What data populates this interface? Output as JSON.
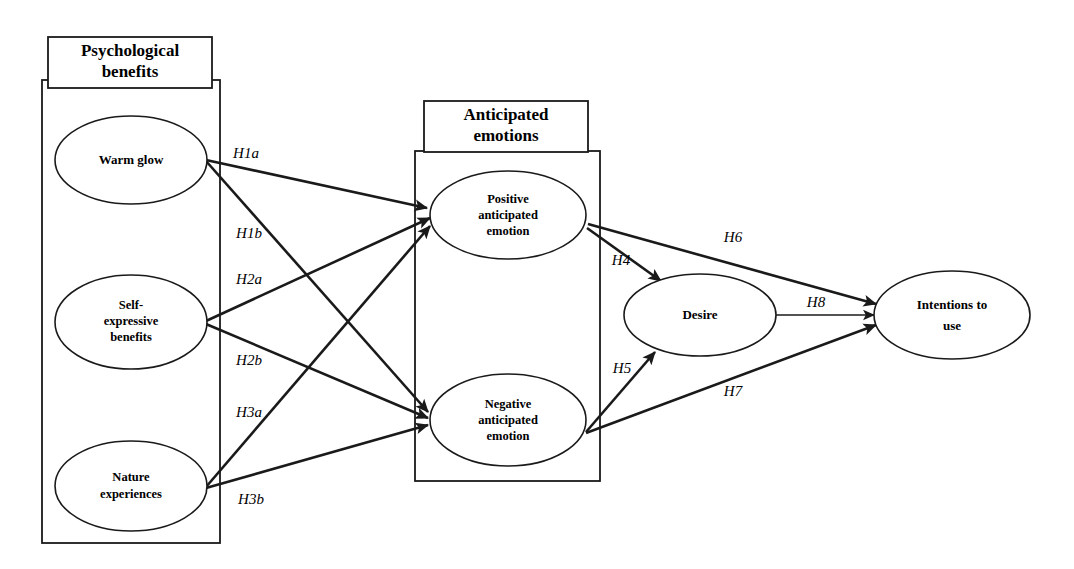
{
  "diagram": {
    "type": "structural-equation-model",
    "title": "",
    "background_color": "#ffffff",
    "line_color": "#1a1a1a",
    "groups": [
      {
        "id": "psychological-benefits",
        "title": "Psychological benefits",
        "title_line1": "Psychological",
        "title_line2": "benefits",
        "frame": {
          "x": 42,
          "y": 80,
          "w": 178,
          "h": 463
        },
        "header": {
          "x": 48,
          "y": 37,
          "w": 164,
          "h": 51
        }
      },
      {
        "id": "anticipated-emotions",
        "title": "Anticipated emotions",
        "title_line1": "Anticipated",
        "title_line2": "emotions",
        "frame": {
          "x": 415,
          "y": 151,
          "w": 185,
          "h": 330
        },
        "header": {
          "x": 424,
          "y": 101,
          "w": 164,
          "h": 51
        }
      }
    ],
    "nodes": [
      {
        "id": "warm-glow",
        "label": "Warm glow",
        "lines": [
          "Warm glow"
        ],
        "cx": 131,
        "cy": 160,
        "rx": 76,
        "ry": 44
      },
      {
        "id": "self-expressive-benefits",
        "label": "Self-expressive benefits",
        "lines": [
          "Self-",
          "expressive",
          "benefits"
        ],
        "cx": 131,
        "cy": 322,
        "rx": 76,
        "ry": 47
      },
      {
        "id": "nature-experiences",
        "label": "Nature experiences",
        "lines": [
          "Nature",
          "experiences"
        ],
        "cx": 131,
        "cy": 486,
        "rx": 76,
        "ry": 45
      },
      {
        "id": "positive-anticipated-emotion",
        "label": "Positive anticipated emotion",
        "lines": [
          "Positive",
          "anticipated",
          "emotion"
        ],
        "cx": 508,
        "cy": 215,
        "rx": 78,
        "ry": 44
      },
      {
        "id": "negative-anticipated-emotion",
        "label": "Negative anticipated emotion",
        "lines": [
          "Negative",
          "anticipated",
          "emotion"
        ],
        "cx": 508,
        "cy": 420,
        "rx": 78,
        "ry": 46
      },
      {
        "id": "desire",
        "label": "Desire",
        "lines": [
          "Desire"
        ],
        "cx": 700,
        "cy": 315,
        "rx": 76,
        "ry": 41
      },
      {
        "id": "intentions-to-use",
        "label": "Intentions to use",
        "lines": [
          "Intentions to",
          "use"
        ],
        "cx": 952,
        "cy": 315,
        "rx": 78,
        "ry": 44
      }
    ],
    "paths": [
      {
        "id": "H1a",
        "label": "H1a",
        "from": "warm-glow",
        "to": "positive-anticipated-emotion",
        "x1": 206,
        "y1": 160,
        "x2": 427,
        "y2": 208,
        "lx": 246,
        "ly": 155
      },
      {
        "id": "H1b",
        "label": "H1b",
        "from": "warm-glow",
        "to": "negative-anticipated-emotion",
        "x1": 206,
        "y1": 161,
        "x2": 428,
        "y2": 412,
        "lx": 249,
        "ly": 235
      },
      {
        "id": "H2a",
        "label": "H2a",
        "from": "self-expressive-benefits",
        "to": "positive-anticipated-emotion",
        "x1": 206,
        "y1": 321,
        "x2": 430,
        "y2": 218,
        "lx": 249,
        "ly": 281
      },
      {
        "id": "H2b",
        "label": "H2b",
        "from": "self-expressive-benefits",
        "to": "negative-anticipated-emotion",
        "x1": 206,
        "y1": 324,
        "x2": 428,
        "y2": 418,
        "lx": 249,
        "ly": 362
      },
      {
        "id": "H3a",
        "label": "H3a",
        "from": "nature-experiences",
        "to": "positive-anticipated-emotion",
        "x1": 206,
        "y1": 487,
        "x2": 430,
        "y2": 226,
        "lx": 249,
        "ly": 414
      },
      {
        "id": "H3b",
        "label": "H3b",
        "from": "nature-experiences",
        "to": "negative-anticipated-emotion",
        "x1": 206,
        "y1": 488,
        "x2": 428,
        "y2": 425,
        "lx": 251,
        "ly": 501
      },
      {
        "id": "H4",
        "label": "H4",
        "from": "positive-anticipated-emotion",
        "to": "desire",
        "x1": 587,
        "y1": 228,
        "x2": 661,
        "y2": 281,
        "lx": 621,
        "ly": 262
      },
      {
        "id": "H5",
        "label": "H5",
        "from": "negative-anticipated-emotion",
        "to": "desire",
        "x1": 586,
        "y1": 432,
        "x2": 655,
        "y2": 352,
        "lx": 622,
        "ly": 370
      },
      {
        "id": "H6",
        "label": "H6",
        "from": "positive-anticipated-emotion",
        "to": "intentions-to-use",
        "x1": 588,
        "y1": 224,
        "x2": 876,
        "y2": 304,
        "lx": 733,
        "ly": 239
      },
      {
        "id": "H7",
        "label": "H7",
        "from": "negative-anticipated-emotion",
        "to": "intentions-to-use",
        "x1": 586,
        "y1": 433,
        "x2": 876,
        "y2": 325,
        "lx": 733,
        "ly": 393
      },
      {
        "id": "H8",
        "label": "H8",
        "from": "desire",
        "to": "intentions-to-use",
        "x1": 776,
        "y1": 315,
        "x2": 875,
        "y2": 315,
        "lx": 816,
        "ly": 304
      }
    ]
  }
}
